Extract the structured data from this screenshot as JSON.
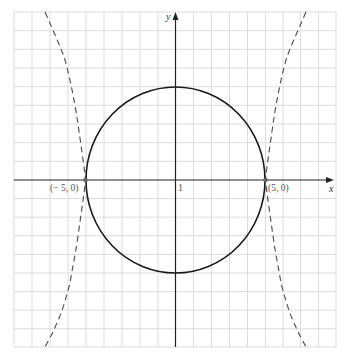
{
  "diagram": {
    "type": "coordinate-plane",
    "axes": {
      "x_label": "x",
      "y_label": "y",
      "unit_label": "1"
    },
    "grid": {
      "cols": 18,
      "rows": 18
    },
    "curves": [
      {
        "name": "circle",
        "equation": "x^2 + y^2 = 25",
        "style": "solid",
        "radius": 5
      },
      {
        "name": "hyperbola",
        "style": "dashed",
        "vertices": [
          "(-5, 0)",
          "(5, 0)"
        ]
      }
    ],
    "points": [
      {
        "label": "(− 5, 0)",
        "x": -5,
        "y": 0
      },
      {
        "label": "(5, 0)",
        "x": 5,
        "y": 0
      }
    ],
    "colors": {
      "grid": "#d9d9d9",
      "axis": "#222222",
      "curve": "#1a1a1a",
      "dashed": "#555555",
      "point": "#666666"
    }
  }
}
